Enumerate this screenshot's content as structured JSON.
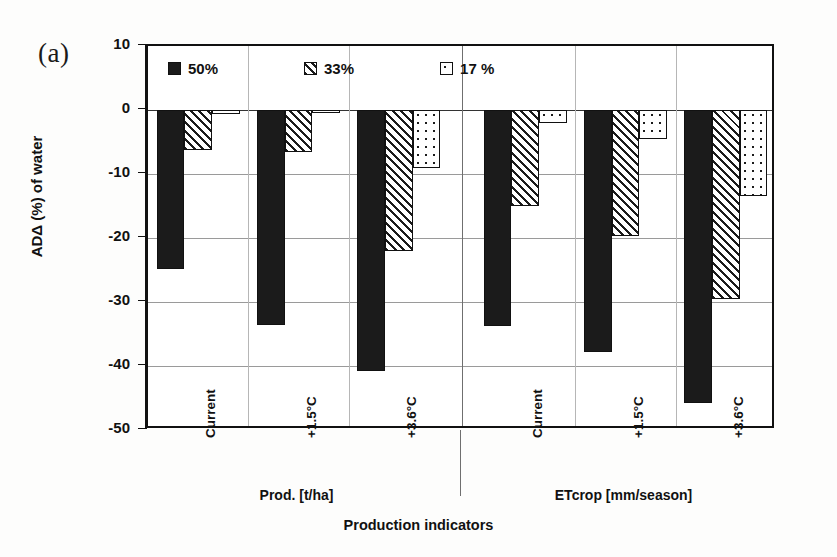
{
  "panel": {
    "label": "(a)"
  },
  "axis_titles": {
    "y": "ADΔ (%) of water",
    "x": "Production indicators"
  },
  "legend": {
    "position": "top-inside",
    "entries": [
      {
        "label": "50%",
        "pattern": "solid"
      },
      {
        "label": "33%",
        "pattern": "hatch"
      },
      {
        "label": "17 %",
        "pattern": "dots"
      }
    ]
  },
  "y_ticks": [
    "10",
    "0",
    "-10",
    "-20",
    "-30",
    "-40",
    "-50"
  ],
  "groups": [
    {
      "label": "Prod. [t/ha]"
    },
    {
      "label": "ETcrop [mm/season]"
    }
  ],
  "categories": [
    "Current",
    "+1.5°C",
    "+3.6°C",
    "Current",
    "+1.5°C",
    "+3.6°C"
  ],
  "chart_data": {
    "type": "bar",
    "title": "",
    "subtitle": "",
    "xlabel": "Production indicators",
    "ylabel": "ADΔ (%) of water",
    "ylim": [
      -50,
      10
    ],
    "ytick_step": 10,
    "grid": true,
    "legend_position": "top-inside",
    "panel_label": "(a)",
    "group_labels": [
      "Prod. [t/ha]",
      "ETcrop [mm/season]"
    ],
    "categories": [
      "Current",
      "+1.5°C",
      "+3.6°C",
      "Current",
      "+1.5°C",
      "+3.6°C"
    ],
    "series": [
      {
        "name": "50%",
        "pattern": "solid",
        "values": [
          -24.8,
          -33.6,
          -40.8,
          -33.8,
          -37.8,
          -45.8
        ]
      },
      {
        "name": "33%",
        "pattern": "hatch",
        "values": [
          -6.3,
          -6.5,
          -22.0,
          -15.0,
          -19.7,
          -29.5
        ]
      },
      {
        "name": "17 %",
        "pattern": "dots",
        "values": [
          -0.6,
          -0.5,
          -9.0,
          -2.0,
          -4.5,
          -13.5
        ]
      }
    ]
  }
}
